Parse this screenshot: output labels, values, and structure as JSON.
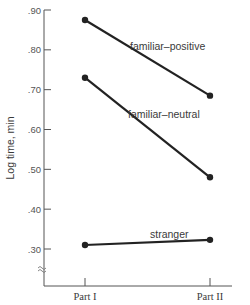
{
  "chart_data": {
    "type": "line",
    "title": "",
    "xlabel": "",
    "ylabel": "Log time, min",
    "categories": [
      "Part I",
      "Part II"
    ],
    "category_display": [
      "Part I",
      "Part II"
    ],
    "ylim": [
      0.25,
      0.9
    ],
    "yticks": [
      0.3,
      0.4,
      0.5,
      0.6,
      0.7,
      0.8,
      0.9
    ],
    "ytick_labels": [
      ".30",
      ".40",
      ".50",
      ".60",
      ".70",
      ".80",
      ".90"
    ],
    "axis_break": true,
    "grid": false,
    "legend": "inline labels",
    "series": [
      {
        "name": "familiar–positive",
        "values": [
          0.875,
          0.685
        ]
      },
      {
        "name": "familiar–neutral",
        "values": [
          0.73,
          0.48
        ]
      },
      {
        "name": "stranger",
        "values": [
          0.31,
          0.323
        ]
      }
    ],
    "line_color": "#222222"
  }
}
